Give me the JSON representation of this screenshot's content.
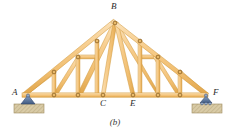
{
  "figure": {
    "caption": "(b)",
    "background_color": "#ffffff",
    "width": 230,
    "height": 135
  },
  "colors": {
    "member_fill": "#f5c77e",
    "member_fill_light": "#fbe0b4",
    "member_edge": "#d79a3c",
    "member_shadow": "#c98a2e",
    "joint_fill": "#e8b96a",
    "joint_edge": "#8a5a18",
    "support_blue": "#6b86ad",
    "support_blue_dark": "#3f5a82",
    "ground_fill": "#d9cba6",
    "ground_edge": "#a8966d",
    "label_color": "#2b2b2b"
  },
  "labels": [
    {
      "id": "label-A",
      "text": "A",
      "x": 12,
      "y": 89
    },
    {
      "id": "label-B",
      "text": "B",
      "x": 111,
      "y": 3
    },
    {
      "id": "label-C",
      "text": "C",
      "x": 100,
      "y": 100
    },
    {
      "id": "label-E",
      "text": "E",
      "x": 131,
      "y": 100
    },
    {
      "id": "label-F",
      "text": "F",
      "x": 213,
      "y": 89
    }
  ],
  "nodes": {
    "A": {
      "x": 24,
      "y": 95
    },
    "B": {
      "x": 115,
      "y": 22
    },
    "C": {
      "x": 103,
      "y": 95
    },
    "E": {
      "x": 133,
      "y": 95
    },
    "F": {
      "x": 207,
      "y": 95
    },
    "L1": {
      "x": 54,
      "y": 72
    },
    "L2": {
      "x": 78,
      "y": 57
    },
    "L3": {
      "x": 97,
      "y": 41
    },
    "R3": {
      "x": 140,
      "y": 41
    },
    "R2": {
      "x": 158,
      "y": 57
    },
    "R1": {
      "x": 180,
      "y": 72
    },
    "BL1": {
      "x": 54,
      "y": 95
    },
    "BL2": {
      "x": 78,
      "y": 95
    },
    "BR2": {
      "x": 158,
      "y": 95
    },
    "BR1": {
      "x": 180,
      "y": 95
    }
  },
  "members": [
    {
      "name": "bottom-chord",
      "from": "A",
      "to": "F",
      "thickness": 4.2
    },
    {
      "name": "top-chord-left-1",
      "from": "A",
      "to": "L1",
      "thickness": 4.2
    },
    {
      "name": "top-chord-left-2",
      "from": "L1",
      "to": "L2",
      "thickness": 4.2
    },
    {
      "name": "top-chord-left-3",
      "from": "L2",
      "to": "L3",
      "thickness": 4.2
    },
    {
      "name": "top-chord-left-4",
      "from": "L3",
      "to": "B",
      "thickness": 4.2
    },
    {
      "name": "top-chord-right-4",
      "from": "B",
      "to": "R3",
      "thickness": 4.2
    },
    {
      "name": "top-chord-right-3",
      "from": "R3",
      "to": "R2",
      "thickness": 4.2
    },
    {
      "name": "top-chord-right-2",
      "from": "R2",
      "to": "R1",
      "thickness": 4.2
    },
    {
      "name": "top-chord-right-1",
      "from": "R1",
      "to": "F",
      "thickness": 4.2
    },
    {
      "name": "web-vert-left-outer",
      "from": "L1",
      "to": "BL1",
      "thickness": 3.6
    },
    {
      "name": "web-vert-left-inner",
      "from": "L2",
      "to": "BL2",
      "thickness": 3.6
    },
    {
      "name": "web-vert-right-inner",
      "from": "R2",
      "to": "BR2",
      "thickness": 3.6
    },
    {
      "name": "web-vert-right-outer",
      "from": "R1",
      "to": "BR1",
      "thickness": 3.6
    },
    {
      "name": "web-diag-left-1",
      "from": "A",
      "to": "L1",
      "thickness": 0
    },
    {
      "name": "web-diag-left-2",
      "from": "BL1",
      "to": "L2",
      "thickness": 3.6
    },
    {
      "name": "web-diag-left-3",
      "from": "BL2",
      "to": "B",
      "thickness": 3.8
    },
    {
      "name": "web-strut-left",
      "from": "L2",
      "to": "L3",
      "thickness": 0
    },
    {
      "name": "web-horiz-left",
      "from": "L2",
      "to": "L3h",
      "thickness": 3.6
    },
    {
      "name": "web-horiz-right",
      "from": "R3h",
      "to": "R2",
      "thickness": 3.6
    },
    {
      "name": "web-diag-right-3",
      "from": "B",
      "to": "BR2",
      "thickness": 3.8
    },
    {
      "name": "web-diag-right-2",
      "from": "R2",
      "to": "BR1",
      "thickness": 3.6
    },
    {
      "name": "web-vert-center-left",
      "from": "L3",
      "to": "C",
      "thickness": 3.6
    },
    {
      "name": "web-vert-center-right",
      "from": "R3",
      "to": "E",
      "thickness": 3.6
    },
    {
      "name": "web-apex-left",
      "from": "B",
      "to": "C",
      "thickness": 3.8
    },
    {
      "name": "web-apex-right",
      "from": "B",
      "to": "E",
      "thickness": 3.8
    }
  ],
  "joints": [
    {
      "name": "joint-A",
      "x": 24,
      "y": 95
    },
    {
      "name": "joint-B",
      "x": 115,
      "y": 22
    },
    {
      "name": "joint-L1",
      "x": 54,
      "y": 72
    },
    {
      "name": "joint-L2",
      "x": 78,
      "y": 57
    },
    {
      "name": "joint-L3",
      "x": 97,
      "y": 41
    },
    {
      "name": "joint-R3",
      "x": 140,
      "y": 41
    },
    {
      "name": "joint-R2",
      "x": 158,
      "y": 57
    },
    {
      "name": "joint-R1",
      "x": 180,
      "y": 72
    },
    {
      "name": "joint-BL1",
      "x": 54,
      "y": 95
    },
    {
      "name": "joint-BL2",
      "x": 78,
      "y": 95
    },
    {
      "name": "joint-C",
      "x": 103,
      "y": 95
    },
    {
      "name": "joint-E",
      "x": 133,
      "y": 95
    },
    {
      "name": "joint-BR2",
      "x": 158,
      "y": 95
    },
    {
      "name": "joint-BR1",
      "x": 180,
      "y": 95
    },
    {
      "name": "joint-F",
      "x": 207,
      "y": 95
    }
  ],
  "supports": {
    "left": {
      "type": "pin-support",
      "x": 28,
      "y": 95,
      "ground_x": 14,
      "ground_y": 104,
      "ground_w": 30,
      "ground_h": 9
    },
    "right": {
      "type": "roller-support",
      "x": 205,
      "y": 95,
      "ground_x": 192,
      "ground_y": 104,
      "ground_w": 30,
      "ground_h": 9
    }
  }
}
